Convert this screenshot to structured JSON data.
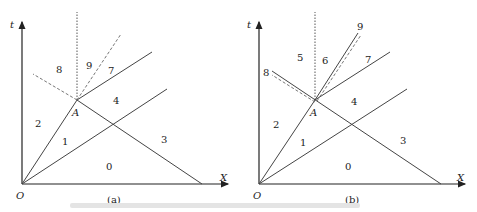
{
  "panels": [
    {
      "id": "a",
      "caption": "(a)",
      "axis_x": "X",
      "axis_t": "t",
      "origin": "O",
      "point": "A",
      "regions": [
        "0",
        "1",
        "2",
        "3",
        "4",
        "7",
        "8",
        "9"
      ]
    },
    {
      "id": "b",
      "caption": "(b)",
      "axis_x": "X",
      "axis_t": "t",
      "origin": "O",
      "point": "A",
      "regions": [
        "0",
        "1",
        "2",
        "3",
        "4",
        "5",
        "6",
        "7",
        "8",
        "9"
      ]
    }
  ],
  "line_color": "#333333",
  "dashed_color": "#555555"
}
